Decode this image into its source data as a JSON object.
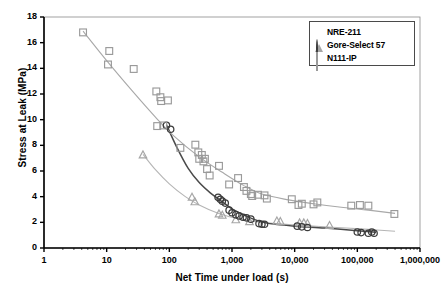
{
  "chart_data": {
    "type": "scatter",
    "title": "",
    "xlabel": "Net Time under load (s)",
    "ylabel": "Stress at Leak (MPa)",
    "xscale": "log",
    "yscale": "linear",
    "xlim": [
      1,
      1000000
    ],
    "ylim": [
      0,
      18
    ],
    "grid": false,
    "legend_position": "top-right",
    "xticks": [
      1,
      10,
      100,
      1000,
      10000,
      100000,
      1000000
    ],
    "xtick_labels": [
      "1",
      "10",
      "100",
      "1,000",
      "10,000",
      "100,000",
      "1,000,000"
    ],
    "yticks": [
      0,
      2,
      4,
      6,
      8,
      10,
      12,
      14,
      16,
      18
    ],
    "ytick_labels": [
      "0",
      "2",
      "4",
      "6",
      "8",
      "10",
      "12",
      "14",
      "16",
      "18"
    ],
    "series": [
      {
        "name": "NRE-211",
        "marker": "triangle",
        "color": "#a6a6a6",
        "trendline_color": "#b5b5b5",
        "points": [
          [
            38,
            7.25
          ],
          [
            230,
            3.95
          ],
          [
            255,
            3.6
          ],
          [
            620,
            2.65
          ],
          [
            700,
            2.55
          ],
          [
            1150,
            2.2
          ],
          [
            1900,
            2.05
          ],
          [
            5200,
            2.1
          ],
          [
            5900,
            2.05
          ],
          [
            12000,
            1.95
          ],
          [
            14000,
            1.95
          ],
          [
            16000,
            1.9
          ],
          [
            36000,
            1.75
          ]
        ],
        "trend": [
          [
            38,
            7.3
          ],
          [
            60,
            6.1
          ],
          [
            100,
            5.0
          ],
          [
            180,
            4.0
          ],
          [
            300,
            3.35
          ],
          [
            600,
            2.7
          ],
          [
            1200,
            2.3
          ],
          [
            3000,
            2.0
          ],
          [
            10000,
            1.8
          ],
          [
            40000,
            1.62
          ],
          [
            150000,
            1.45
          ],
          [
            400000,
            1.3
          ]
        ]
      },
      {
        "name": "Gore-Select 57",
        "marker": "circle",
        "color": "#3b3b3b",
        "trendline_color": "#4a4a4a",
        "points": [
          [
            90,
            9.55
          ],
          [
            105,
            9.25
          ],
          [
            600,
            3.95
          ],
          [
            650,
            3.8
          ],
          [
            700,
            3.65
          ],
          [
            780,
            3.5
          ],
          [
            900,
            2.95
          ],
          [
            1000,
            2.75
          ],
          [
            1150,
            2.6
          ],
          [
            1300,
            2.5
          ],
          [
            1500,
            2.4
          ],
          [
            1700,
            2.35
          ],
          [
            2000,
            2.25
          ],
          [
            2700,
            1.9
          ],
          [
            3000,
            1.85
          ],
          [
            3300,
            1.85
          ],
          [
            11000,
            1.7
          ],
          [
            13000,
            1.65
          ],
          [
            16000,
            1.6
          ],
          [
            100000,
            1.25
          ],
          [
            115000,
            1.2
          ],
          [
            150000,
            1.15
          ],
          [
            170000,
            1.25
          ],
          [
            185000,
            1.15
          ]
        ],
        "trend": [
          [
            90,
            9.6
          ],
          [
            130,
            7.9
          ],
          [
            200,
            6.2
          ],
          [
            300,
            5.1
          ],
          [
            450,
            4.3
          ],
          [
            700,
            3.6
          ],
          [
            1000,
            3.05
          ],
          [
            1500,
            2.6
          ],
          [
            2500,
            2.15
          ],
          [
            4000,
            1.9
          ],
          [
            10000,
            1.7
          ],
          [
            30000,
            1.55
          ],
          [
            100000,
            1.35
          ],
          [
            200000,
            1.22
          ]
        ]
      },
      {
        "name": "N111-IP",
        "marker": "square",
        "color": "#9a9a9a",
        "trendline_color": "#a8a8a8",
        "points": [
          [
            4.2,
            16.8
          ],
          [
            11,
            15.35
          ],
          [
            10.5,
            14.3
          ],
          [
            27,
            13.95
          ],
          [
            62,
            12.2
          ],
          [
            72,
            11.75
          ],
          [
            74,
            11.45
          ],
          [
            95,
            11.5
          ],
          [
            64,
            9.5
          ],
          [
            80,
            9.55
          ],
          [
            150,
            7.8
          ],
          [
            260,
            8.05
          ],
          [
            290,
            7.45
          ],
          [
            300,
            6.95
          ],
          [
            330,
            7.25
          ],
          [
            350,
            6.75
          ],
          [
            370,
            6.95
          ],
          [
            400,
            6.15
          ],
          [
            440,
            5.65
          ],
          [
            620,
            6.4
          ],
          [
            900,
            4.95
          ],
          [
            1250,
            5.45
          ],
          [
            1550,
            4.75
          ],
          [
            1700,
            4.45
          ],
          [
            2000,
            4.2
          ],
          [
            2100,
            4.05
          ],
          [
            2600,
            4.15
          ],
          [
            3300,
            4.1
          ],
          [
            3600,
            3.85
          ],
          [
            9000,
            3.8
          ],
          [
            11500,
            3.35
          ],
          [
            13000,
            3.45
          ],
          [
            20000,
            3.4
          ],
          [
            23000,
            3.55
          ],
          [
            80000,
            3.3
          ],
          [
            110000,
            3.35
          ],
          [
            150000,
            3.3
          ],
          [
            390000,
            2.65
          ]
        ],
        "trend": [
          [
            4.2,
            16.9
          ],
          [
            10,
            14.6
          ],
          [
            25,
            12.3
          ],
          [
            60,
            10.2
          ],
          [
            120,
            8.7
          ],
          [
            300,
            7.1
          ],
          [
            700,
            5.9
          ],
          [
            1500,
            4.9
          ],
          [
            3000,
            4.2
          ],
          [
            8000,
            3.75
          ],
          [
            20000,
            3.45
          ],
          [
            60000,
            3.15
          ],
          [
            150000,
            2.95
          ],
          [
            400000,
            2.7
          ]
        ]
      }
    ]
  },
  "legend": {
    "items": [
      {
        "label": "NRE-211",
        "marker": "triangle"
      },
      {
        "label": "Gore-Select 57",
        "marker": "circle"
      },
      {
        "label": "N111-IP",
        "marker": "square"
      }
    ]
  },
  "colors": {
    "axis": "#000000",
    "nre211": "#a6a6a6",
    "gore57": "#3b3b3b",
    "n111ip": "#9a9a9a",
    "background": "#ffffff"
  }
}
